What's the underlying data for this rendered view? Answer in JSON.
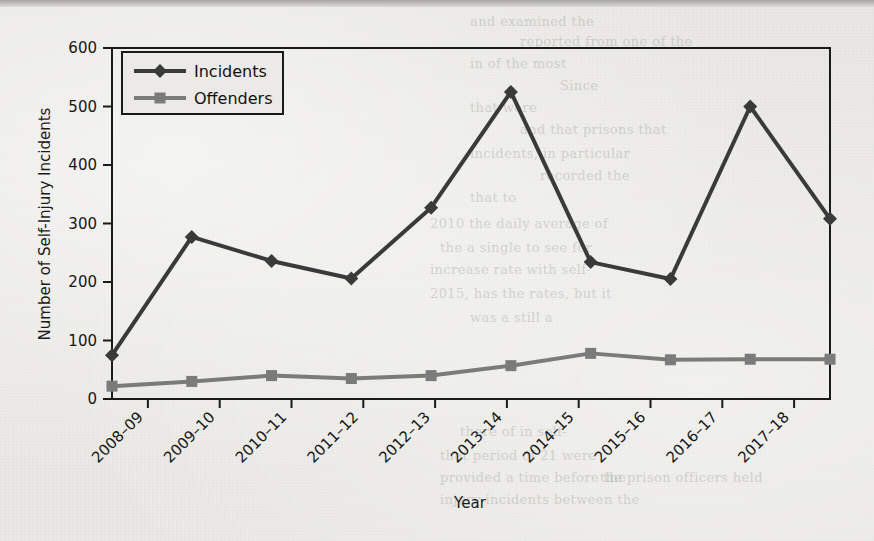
{
  "page": {
    "background_color": "#e9e8e4",
    "bleed_through_lines": [
      {
        "text": "and examined the",
        "x": 470,
        "y": 14
      },
      {
        "text": "reported from one of the",
        "x": 520,
        "y": 34
      },
      {
        "text": "in of the most",
        "x": 470,
        "y": 56
      },
      {
        "text": "Since",
        "x": 560,
        "y": 78
      },
      {
        "text": "that were",
        "x": 470,
        "y": 100
      },
      {
        "text": "and that prisons that",
        "x": 520,
        "y": 122
      },
      {
        "text": "incidents, in particular",
        "x": 470,
        "y": 146
      },
      {
        "text": "recorded the",
        "x": 540,
        "y": 168
      },
      {
        "text": "that to",
        "x": 470,
        "y": 190
      },
      {
        "text": "2010 the daily average of",
        "x": 430,
        "y": 216
      },
      {
        "text": "the a single to see for",
        "x": 440,
        "y": 240
      },
      {
        "text": "increase rate with self-",
        "x": 430,
        "y": 262
      },
      {
        "text": "2015, has the rates, but it",
        "x": 430,
        "y": 286
      },
      {
        "text": "was a still a",
        "x": 470,
        "y": 310
      },
      {
        "text": "there of in self-",
        "x": 460,
        "y": 424
      },
      {
        "text": "that period of 21 were",
        "x": 440,
        "y": 448
      },
      {
        "text": "provided a time before the",
        "x": 440,
        "y": 470
      },
      {
        "text": "injury incidents between the",
        "x": 440,
        "y": 492
      },
      {
        "text": "the prison officers held",
        "x": 600,
        "y": 470
      }
    ]
  },
  "chart_data": {
    "type": "line",
    "title": "",
    "xlabel": "Year",
    "ylabel": "Number of Self-Injury Incidents",
    "xlim_labels": [
      "2008-09",
      "2017-18"
    ],
    "ylim": [
      0,
      600
    ],
    "yticks": [
      0,
      100,
      200,
      300,
      400,
      500,
      600
    ],
    "grid": false,
    "legend_position": "top-left-inside",
    "categories": [
      "2008–09",
      "2009–10",
      "2010–11",
      "2011–12",
      "2012–13",
      "2013–14",
      "2014–15",
      "2015–16",
      "2016–17",
      "2017–18"
    ],
    "series": [
      {
        "name": "Incidents",
        "marker": "diamond",
        "color": "#3a3a3a",
        "values": [
          75,
          277,
          236,
          206,
          327,
          525,
          234,
          205,
          500,
          308
        ]
      },
      {
        "name": "Offenders",
        "marker": "square",
        "color": "#7b7b7b",
        "values": [
          22,
          30,
          40,
          35,
          40,
          57,
          78,
          67,
          68,
          68
        ]
      }
    ],
    "plot_points": {
      "incidents": [
        75,
        277,
        236,
        206,
        327,
        525,
        234,
        205,
        500,
        308
      ],
      "offenders": [
        22,
        30,
        40,
        35,
        40,
        57,
        78,
        67,
        68,
        68
      ]
    }
  },
  "legend": {
    "entries": [
      {
        "label": "Incidents",
        "marker": "diamond-marker",
        "color": "#3a3a3a"
      },
      {
        "label": "Offenders",
        "marker": "square-marker",
        "color": "#7b7b7b"
      }
    ]
  }
}
